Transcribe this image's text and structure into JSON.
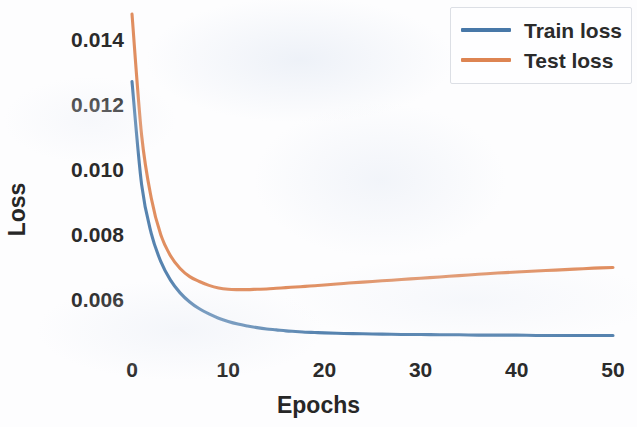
{
  "chart_data": {
    "type": "line",
    "title": "",
    "xlabel": "Epochs",
    "ylabel": "Loss",
    "xlim": [
      -0.8,
      50.0
    ],
    "ylim": [
      0.00455,
      0.0152
    ],
    "grid": false,
    "legend_position": "upper right",
    "xticks": [
      0,
      10,
      20,
      30,
      40,
      50
    ],
    "xtick_labels": [
      "0",
      "10",
      "20",
      "30",
      "40",
      "50"
    ],
    "yticks": [
      0.006,
      0.008,
      0.01,
      0.012,
      0.014
    ],
    "ytick_labels": [
      "0.006",
      "0.008",
      "0.010",
      "0.012",
      "0.014"
    ],
    "x": [
      0,
      1,
      2,
      3,
      4,
      5,
      6,
      7,
      8,
      9,
      10,
      11,
      12,
      13,
      14,
      15,
      16,
      17,
      18,
      19,
      20,
      22,
      24,
      26,
      28,
      30,
      32,
      34,
      36,
      38,
      40,
      42,
      44,
      46,
      48,
      50
    ],
    "series": [
      {
        "name": "Train loss",
        "color": "#4878a8",
        "values": [
          0.01272,
          0.00955,
          0.00805,
          0.00718,
          0.00661,
          0.00622,
          0.00594,
          0.00573,
          0.00557,
          0.00544,
          0.00534,
          0.00526,
          0.0052,
          0.00515,
          0.00511,
          0.00508,
          0.00505,
          0.00503,
          0.00501,
          0.005,
          0.00499,
          0.00497,
          0.00496,
          0.00495,
          0.00494,
          0.00494,
          0.00493,
          0.00493,
          0.00492,
          0.00492,
          0.00492,
          0.00491,
          0.00491,
          0.00491,
          0.00491,
          0.00491
        ]
      },
      {
        "name": "Test loss",
        "color": "#dd8452",
        "values": [
          0.0148,
          0.01107,
          0.00914,
          0.008,
          0.00736,
          0.00697,
          0.00672,
          0.00657,
          0.00645,
          0.00637,
          0.00633,
          0.00632,
          0.00632,
          0.00633,
          0.00634,
          0.00636,
          0.00638,
          0.0064,
          0.00642,
          0.00644,
          0.00646,
          0.00651,
          0.00655,
          0.00659,
          0.00663,
          0.00667,
          0.00671,
          0.00675,
          0.00679,
          0.00683,
          0.00686,
          0.00689,
          0.00692,
          0.00695,
          0.00698,
          0.007
        ]
      }
    ],
    "annotations": {
      "test_loss_minimum_epoch": 11,
      "test_loss_minimum_value": 0.00632
    }
  },
  "axes": {
    "ylabel": "Loss",
    "xlabel": "Epochs"
  },
  "legend": {
    "entries": [
      {
        "label": "Train loss",
        "color": "#4878a8"
      },
      {
        "label": "Test loss",
        "color": "#dd8452"
      }
    ]
  },
  "colors": {
    "train": "#4878a8",
    "test": "#dd8452",
    "text": "#2b2b2b",
    "background": "#fdfdfe",
    "legend_border": "#dcdfe5"
  }
}
